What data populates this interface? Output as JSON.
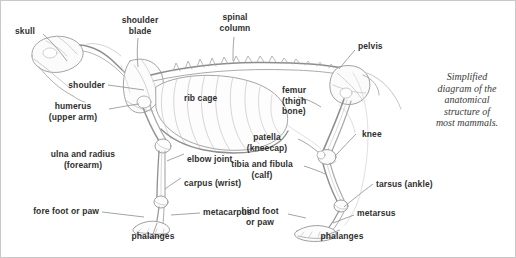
{
  "figure": {
    "title_caption": "Simplified\ndiagram of the\nanatomical\nstructure of\nmost mammals.",
    "background_color": "#ffffff",
    "border_color": "#c9c9c9",
    "ink_color": "#8a8a8a",
    "text_color": "#2f2f2f"
  },
  "labels": {
    "skull": "skull",
    "shoulder_blade": "shoulder\nblade",
    "spinal_column": "spinal\ncolumn",
    "pelvis": "pelvis",
    "shoulder": "shoulder",
    "humerus": "humerus\n(upper arm)",
    "rib_cage": "rib cage",
    "femur": "femur\n(thigh\nbone)",
    "knee": "knee",
    "patella": "patella\n(kneecap)",
    "ulna_radius": "ulna and radius\n(forearm)",
    "elbow_joint": "elbow joint",
    "tibia_fibula": "tibia and fibula\n(calf)",
    "carpus": "carpus (wrist)",
    "tarsus": "tarsus (ankle)",
    "fore_foot": "fore foot or paw",
    "metacarpus": "metacarpus",
    "hind_foot": "hind foot\nor paw",
    "metarsus": "metarsus",
    "phalanges_front": "phalanges",
    "phalanges_back": "phalanges"
  }
}
